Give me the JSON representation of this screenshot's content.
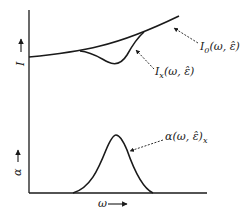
{
  "figure": {
    "axes": {
      "y_label_top": "I",
      "y_label_bottom": "α",
      "x_label": "ω",
      "arrow": "→"
    },
    "curves": {
      "I0": {
        "base": "I",
        "sub": "0",
        "args": "(ω, ε̂)"
      },
      "Ix": {
        "base": "I",
        "sub": "x",
        "args": "(ω, ε̂)"
      },
      "alpha": {
        "base": "α(ω, ε̂)",
        "sub": "x"
      }
    },
    "colors": {
      "line": "#1a1a1a",
      "background": "#ffffff"
    }
  }
}
